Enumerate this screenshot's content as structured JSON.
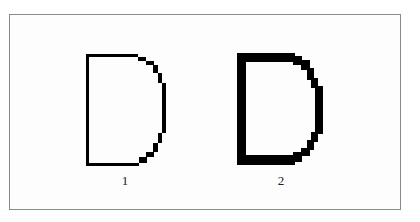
{
  "figure": {
    "panels": [
      {
        "label": "1",
        "letter": "D",
        "stroke": "thin"
      },
      {
        "label": "2",
        "letter": "D",
        "stroke": "thick"
      }
    ],
    "colors": {
      "ink": "#000000",
      "frame": "#8a8a8a",
      "background": "#ffffff"
    }
  }
}
